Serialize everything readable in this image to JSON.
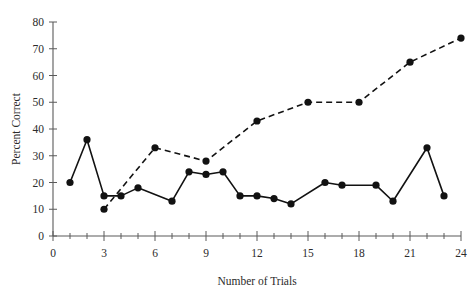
{
  "chart_data": {
    "type": "line",
    "title": "",
    "xlabel": "Number of Trials",
    "ylabel": "Percent Correct",
    "xlim": [
      0,
      24
    ],
    "ylim": [
      0,
      80
    ],
    "grid": false,
    "legend": "none",
    "x_tick_labels": [
      "0",
      "3",
      "6",
      "9",
      "12",
      "15",
      "18",
      "21",
      "24"
    ],
    "x_tick_values": [
      0,
      3,
      6,
      9,
      12,
      15,
      18,
      21,
      24
    ],
    "x_minor_tick_values": [
      1,
      2,
      4,
      5,
      7,
      8,
      10,
      11,
      13,
      14,
      16,
      17,
      19,
      20,
      22,
      23
    ],
    "y_tick_labels": [
      "0",
      "10",
      "20",
      "30",
      "40",
      "50",
      "60",
      "70",
      "80"
    ],
    "y_tick_values": [
      0,
      10,
      20,
      30,
      40,
      50,
      60,
      70,
      80
    ],
    "series": [
      {
        "name": "solid-series",
        "style": "solid",
        "marker": "filled-circle",
        "color": "#121212",
        "x": [
          1,
          2,
          3,
          4,
          5,
          7,
          8,
          9,
          10,
          11,
          12,
          13,
          14,
          16,
          17,
          19,
          20,
          22,
          23
        ],
        "values": [
          20,
          36,
          15,
          15,
          18,
          13,
          24,
          23,
          24,
          15,
          15,
          14,
          12,
          20,
          19,
          19,
          13,
          33,
          15
        ]
      },
      {
        "name": "dashed-series",
        "style": "dashed",
        "marker": "filled-circle",
        "color": "#121212",
        "x": [
          3,
          6,
          9,
          12,
          15,
          18,
          21,
          24
        ],
        "values": [
          10,
          33,
          28,
          43,
          50,
          50,
          65,
          74
        ]
      }
    ]
  }
}
